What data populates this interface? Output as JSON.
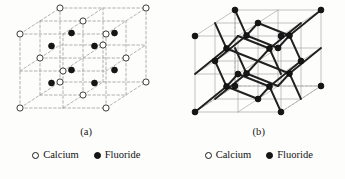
{
  "figure": {
    "background_color": "#fdfdfc",
    "ink_color": "#1a1a1a"
  },
  "legend_common": {
    "entries": [
      {
        "marker": "open-circle-icon",
        "label": "Calcium",
        "color": "#ffffff",
        "stroke": "#1a1a1a"
      },
      {
        "marker": "filled-circle-icon",
        "label": "Fluoride",
        "color": "#161616",
        "stroke": "#0d0d0d"
      }
    ]
  },
  "panels": [
    {
      "id": "a",
      "caption": "(a)",
      "style": "dashed-wireframe-unit-cell",
      "line_style": "dashed",
      "line_color": "#8c8c8c",
      "cube": {
        "origin": [
          20,
          108
        ],
        "ax": [
          86,
          0
        ],
        "ay": [
          0,
          -74
        ],
        "az": [
          40,
          -26
        ],
        "subdivisions": 2
      },
      "calcium_sites": {
        "marker": "open-circle-icon",
        "radius": 3.1,
        "fill": "#ffffff",
        "stroke": "#1a1a1a",
        "fractional": [
          [
            0,
            0,
            0
          ],
          [
            1,
            0,
            0
          ],
          [
            0,
            1,
            0
          ],
          [
            1,
            1,
            0
          ],
          [
            0,
            0,
            1
          ],
          [
            1,
            0,
            1
          ],
          [
            0,
            1,
            1
          ],
          [
            1,
            1,
            1
          ],
          [
            0.5,
            0.5,
            0
          ],
          [
            0.5,
            0.5,
            1
          ],
          [
            0.5,
            0,
            0.5
          ],
          [
            0.5,
            1,
            0.5
          ],
          [
            0,
            0.5,
            0.5
          ],
          [
            1,
            0.5,
            0.5
          ]
        ]
      },
      "fluoride_sites": {
        "marker": "filled-circle-icon",
        "radius": 2.9,
        "fill": "#161616",
        "stroke": "#0d0d0d",
        "fractional": [
          [
            0.25,
            0.25,
            0.25
          ],
          [
            0.75,
            0.25,
            0.25
          ],
          [
            0.25,
            0.75,
            0.25
          ],
          [
            0.75,
            0.75,
            0.25
          ],
          [
            0.25,
            0.25,
            0.75
          ],
          [
            0.75,
            0.25,
            0.75
          ],
          [
            0.25,
            0.75,
            0.75
          ],
          [
            0.75,
            0.75,
            0.75
          ]
        ]
      }
    },
    {
      "id": "b",
      "caption": "(b)",
      "style": "ball-and-stick-tetrahedra",
      "line_style": "solid",
      "line_color": "#9a9a9a",
      "bond_color": "#202020",
      "cube": {
        "origin": [
          22,
          112
        ],
        "ax": [
          86,
          0
        ],
        "ay": [
          0,
          -76
        ],
        "az": [
          40,
          -26
        ],
        "subdivisions": 2
      },
      "node_marker": "filled-circle-icon",
      "node_radius": 2.9,
      "node_fill": "#161616",
      "node_stroke": "#0d0d0d",
      "bond_width": 1.9,
      "centers": [
        [
          0.25,
          0.25,
          0.25
        ],
        [
          0.75,
          0.25,
          0.25
        ],
        [
          0.25,
          0.75,
          0.25
        ],
        [
          0.75,
          0.75,
          0.25
        ],
        [
          0.25,
          0.25,
          0.75
        ],
        [
          0.75,
          0.25,
          0.75
        ],
        [
          0.25,
          0.75,
          0.75
        ],
        [
          0.75,
          0.75,
          0.75
        ]
      ],
      "corner_nodes": [
        [
          0,
          0,
          0
        ],
        [
          1,
          0,
          0
        ],
        [
          0,
          1,
          0
        ],
        [
          1,
          1,
          0
        ],
        [
          0,
          0,
          1
        ],
        [
          1,
          0,
          1
        ],
        [
          0,
          1,
          1
        ],
        [
          1,
          1,
          1
        ],
        [
          0.5,
          0.5,
          0
        ],
        [
          0.5,
          0.5,
          1
        ],
        [
          0.5,
          0,
          0.5
        ],
        [
          0.5,
          1,
          0.5
        ],
        [
          0,
          0.5,
          0.5
        ],
        [
          1,
          0.5,
          0.5
        ]
      ]
    }
  ],
  "chart_data": {
    "type": "diagram",
    "subfigures": [
      "(a)",
      "(b)"
    ],
    "legend": [
      "Calcium",
      "Fluoride"
    ]
  }
}
